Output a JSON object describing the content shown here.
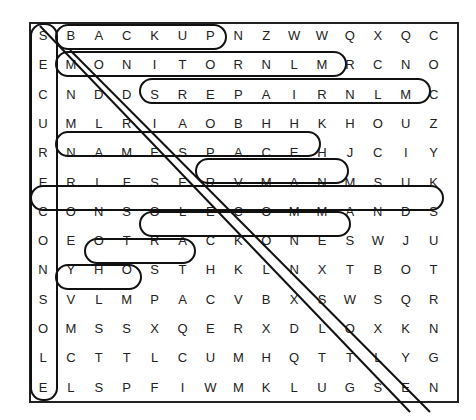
{
  "puzzle": {
    "type": "word-search",
    "rows": 15,
    "cols": 16,
    "grid": [
      [
        "S",
        "B",
        "A",
        "C",
        "K",
        "U",
        "P",
        "N",
        "Z",
        "W",
        "W",
        "Q",
        "X",
        "Q",
        "C"
      ],
      [
        "E",
        "M",
        "O",
        "N",
        "I",
        "T",
        "O",
        "R",
        "N",
        "L",
        "M",
        "R",
        "C",
        "N",
        "O"
      ],
      [
        "C",
        "N",
        "D",
        "D",
        "S",
        "R",
        "E",
        "P",
        "A",
        "I",
        "R",
        "N",
        "L",
        "M",
        "C"
      ],
      [
        "U",
        "M",
        "L",
        "R",
        "I",
        "A",
        "O",
        "B",
        "H",
        "H",
        "K",
        "H",
        "O",
        "U",
        "Z"
      ],
      [
        "R",
        "N",
        "A",
        "M",
        "E",
        "S",
        "P",
        "A",
        "C",
        "E",
        "H",
        "J",
        "C",
        "I",
        "Y"
      ],
      [
        "E",
        "R",
        "L",
        "F",
        "S",
        "E",
        "R",
        "V",
        "M",
        "A",
        "N",
        "M",
        "S",
        "U",
        "K"
      ],
      [
        "C",
        "O",
        "N",
        "S",
        "O",
        "L",
        "E",
        "C",
        "O",
        "M",
        "M",
        "A",
        "N",
        "D",
        "S"
      ],
      [
        "O",
        "E",
        "O",
        "T",
        "R",
        "A",
        "C",
        "K",
        "O",
        "N",
        "E",
        "S",
        "W",
        "J",
        "U"
      ],
      [
        "N",
        "Y",
        "H",
        "O",
        "S",
        "T",
        "H",
        "K",
        "L",
        "N",
        "X",
        "T",
        "B",
        "O",
        "T"
      ],
      [
        "S",
        "V",
        "L",
        "M",
        "P",
        "A",
        "C",
        "V",
        "B",
        "X",
        "S",
        "W",
        "S",
        "Q",
        "R"
      ],
      [
        "O",
        "M",
        "S",
        "S",
        "X",
        "Q",
        "E",
        "R",
        "X",
        "D",
        "L",
        "O",
        "X",
        "K",
        "N"
      ],
      [
        "L",
        "C",
        "T",
        "T",
        "L",
        "C",
        "U",
        "M",
        "H",
        "Q",
        "T",
        "T",
        "L",
        "Y",
        "G"
      ],
      [
        "E",
        "L",
        "S",
        "P",
        "F",
        "I",
        "W",
        "M",
        "K",
        "L",
        "U",
        "G",
        "S",
        "E",
        "N"
      ]
    ],
    "found_words": [
      "SECURE",
      "BACKUP",
      "MONITORNLM",
      "SREPAIRNLM",
      "NAMESPACE",
      "SERVMAN",
      "CONSOLECOMMANDS",
      "CONSOLE",
      "TRACKON",
      "HOST",
      "VLMP",
      "SS",
      "RMF",
      "TSX"
    ]
  }
}
